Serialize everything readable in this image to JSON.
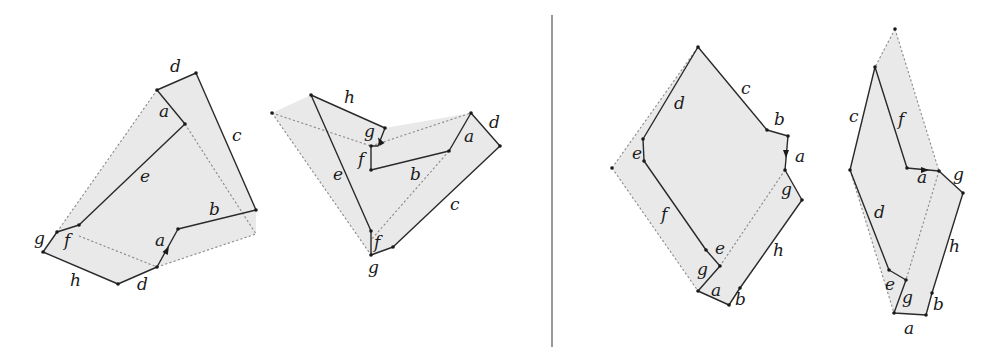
{
  "diagram": {
    "width": 984,
    "height": 357,
    "colors": {
      "fill": "#e9e9e9",
      "solid": "#2a2a2a",
      "dashed": "#8a8a8a",
      "divider": "#555555"
    },
    "divider": {
      "x": 552,
      "y1": 15,
      "y2": 347
    },
    "figures": [
      {
        "name": "figure-1",
        "fill": [
          [
            157,
            90
          ],
          [
            196,
            73
          ],
          [
            256,
            210
          ],
          [
            256,
            234
          ],
          [
            157,
            267
          ],
          [
            118,
            284
          ],
          [
            43,
            252
          ],
          [
            57,
            232
          ]
        ],
        "solid": [
          [
            [
              157,
              90
            ],
            [
              196,
              73
            ],
            [
              256,
              210
            ],
            [
              178,
              229
            ],
            [
              157,
              267
            ],
            [
              118,
              284
            ],
            [
              43,
              252
            ],
            [
              57,
              232
            ],
            [
              79,
              225
            ],
            [
              185,
              124
            ],
            [
              157,
              90
            ]
          ]
        ],
        "dashed": [
          [
            [
              57,
              232
            ],
            [
              157,
              90
            ]
          ],
          [
            [
              185,
              124
            ],
            [
              256,
              234
            ],
            [
              157,
              267
            ]
          ],
          [
            [
              79,
              236
            ],
            [
              157,
              267
            ]
          ]
        ],
        "arrows": [
          [
            167,
            250,
            -62
          ]
        ],
        "dots": [
          [
            157,
            90
          ],
          [
            196,
            73
          ],
          [
            185,
            124
          ],
          [
            256,
            210
          ],
          [
            178,
            229
          ],
          [
            157,
            267
          ],
          [
            118,
            284
          ],
          [
            43,
            252
          ],
          [
            57,
            232
          ],
          [
            79,
            225
          ]
        ],
        "labels": [
          {
            "t": "d",
            "x": 170,
            "y": 72
          },
          {
            "t": "a",
            "x": 159,
            "y": 117
          },
          {
            "t": "c",
            "x": 232,
            "y": 141
          },
          {
            "t": "e",
            "x": 140,
            "y": 182
          },
          {
            "t": "b",
            "x": 209,
            "y": 215
          },
          {
            "t": "g",
            "x": 34,
            "y": 244
          },
          {
            "t": "f",
            "x": 64,
            "y": 246
          },
          {
            "t": "a",
            "x": 155,
            "y": 246
          },
          {
            "t": "h",
            "x": 70,
            "y": 286
          },
          {
            "t": "d",
            "x": 137,
            "y": 290
          }
        ]
      },
      {
        "name": "figure-2",
        "fill": [
          [
            272,
            113
          ],
          [
            311,
            95
          ],
          [
            385,
            128
          ],
          [
            471,
            113
          ],
          [
            500,
            146
          ],
          [
            393,
            247
          ],
          [
            371,
            255
          ]
        ],
        "solid": [
          [
            [
              311,
              95
            ],
            [
              385,
              128
            ],
            [
              378,
              146
            ],
            [
              371,
              146
            ],
            [
              371,
              170
            ],
            [
              449,
              151
            ],
            [
              471,
              113
            ],
            [
              500,
              146
            ],
            [
              393,
              247
            ],
            [
              371,
              255
            ],
            [
              371,
              231
            ],
            [
              311,
              95
            ]
          ]
        ],
        "dashed": [
          [
            [
              272,
              113
            ],
            [
              371,
              255
            ]
          ],
          [
            [
              272,
              113
            ],
            [
              371,
              146
            ]
          ],
          [
            [
              371,
              146
            ],
            [
              471,
              113
            ]
          ],
          [
            [
              449,
              151
            ],
            [
              371,
              240
            ]
          ]
        ],
        "arrows": [
          [
            380,
            141,
            -120
          ]
        ],
        "dots": [
          [
            311,
            95
          ],
          [
            385,
            128
          ],
          [
            371,
            146
          ],
          [
            371,
            170
          ],
          [
            449,
            151
          ],
          [
            471,
            113
          ],
          [
            500,
            146
          ],
          [
            393,
            247
          ],
          [
            371,
            255
          ],
          [
            371,
            231
          ],
          [
            272,
            113
          ]
        ],
        "labels": [
          {
            "t": "h",
            "x": 344,
            "y": 103
          },
          {
            "t": "g",
            "x": 364,
            "y": 137
          },
          {
            "t": "f",
            "x": 358,
            "y": 165
          },
          {
            "t": "a",
            "x": 464,
            "y": 142
          },
          {
            "t": "d",
            "x": 489,
            "y": 128
          },
          {
            "t": "e",
            "x": 333,
            "y": 180
          },
          {
            "t": "b",
            "x": 410,
            "y": 180
          },
          {
            "t": "c",
            "x": 450,
            "y": 210
          },
          {
            "t": "f",
            "x": 374,
            "y": 248
          },
          {
            "t": "g",
            "x": 368,
            "y": 273
          }
        ]
      },
      {
        "name": "figure-3",
        "fill": [
          [
            698,
            47
          ],
          [
            767,
            130
          ],
          [
            788,
            136
          ],
          [
            785,
            170
          ],
          [
            802,
            200
          ],
          [
            729,
            305
          ],
          [
            698,
            291
          ],
          [
            612,
            168
          ]
        ],
        "solid": [
          [
            [
              698,
              47
            ],
            [
              767,
              130
            ],
            [
              788,
              136
            ],
            [
              785,
              170
            ],
            [
              802,
              200
            ],
            [
              740,
              288
            ],
            [
              729,
              305
            ],
            [
              698,
              291
            ],
            [
              720,
              266
            ],
            [
              706,
              250
            ],
            [
              644,
              161
            ],
            [
              643,
              139
            ],
            [
              698,
              47
            ]
          ]
        ],
        "dashed": [
          [
            [
              612,
              168
            ],
            [
              698,
              47
            ]
          ],
          [
            [
              612,
              168
            ],
            [
              698,
              291
            ]
          ],
          [
            [
              785,
              170
            ],
            [
              720,
              266
            ]
          ]
        ],
        "arrows": [
          [
            786,
            154,
            90
          ]
        ],
        "dots": [
          [
            698,
            47
          ],
          [
            767,
            130
          ],
          [
            788,
            136
          ],
          [
            785,
            170
          ],
          [
            802,
            200
          ],
          [
            740,
            288
          ],
          [
            729,
            305
          ],
          [
            698,
            291
          ],
          [
            720,
            266
          ],
          [
            706,
            250
          ],
          [
            644,
            161
          ],
          [
            643,
            139
          ],
          [
            612,
            168
          ]
        ],
        "labels": [
          {
            "t": "c",
            "x": 741,
            "y": 94
          },
          {
            "t": "d",
            "x": 674,
            "y": 109
          },
          {
            "t": "b",
            "x": 774,
            "y": 125
          },
          {
            "t": "a",
            "x": 795,
            "y": 162
          },
          {
            "t": "e",
            "x": 632,
            "y": 159
          },
          {
            "t": "g",
            "x": 781,
            "y": 195
          },
          {
            "t": "f",
            "x": 661,
            "y": 220
          },
          {
            "t": "h",
            "x": 773,
            "y": 256
          },
          {
            "t": "e",
            "x": 715,
            "y": 254
          },
          {
            "t": "g",
            "x": 697,
            "y": 275
          },
          {
            "t": "a",
            "x": 711,
            "y": 296
          },
          {
            "t": "b",
            "x": 735,
            "y": 305
          }
        ]
      },
      {
        "name": "figure-4",
        "fill": [
          [
            895,
            29
          ],
          [
            939,
            171
          ],
          [
            963,
            193
          ],
          [
            932,
            293
          ],
          [
            926,
            315
          ],
          [
            894,
            313
          ],
          [
            850,
            170
          ],
          [
            875,
            67
          ]
        ],
        "solid": [
          [
            [
              875,
              67
            ],
            [
              850,
              170
            ],
            [
              889,
              270
            ],
            [
              906,
              280
            ],
            [
              894,
              313
            ],
            [
              926,
              315
            ],
            [
              932,
              293
            ],
            [
              963,
              193
            ],
            [
              939,
              171
            ],
            [
              907,
              168
            ],
            [
              875,
              67
            ]
          ]
        ],
        "dashed": [
          [
            [
              895,
              29
            ],
            [
              939,
              171
            ]
          ],
          [
            [
              895,
              29
            ],
            [
              875,
              67
            ]
          ],
          [
            [
              850,
              170
            ],
            [
              894,
              313
            ]
          ],
          [
            [
              939,
              171
            ],
            [
              906,
              280
            ]
          ]
        ],
        "arrows": [
          [
            925,
            170,
            0
          ]
        ],
        "dots": [
          [
            895,
            29
          ],
          [
            875,
            67
          ],
          [
            850,
            170
          ],
          [
            907,
            168
          ],
          [
            939,
            171
          ],
          [
            963,
            193
          ],
          [
            932,
            293
          ],
          [
            926,
            315
          ],
          [
            894,
            313
          ],
          [
            906,
            280
          ],
          [
            889,
            270
          ]
        ],
        "labels": [
          {
            "t": "c",
            "x": 849,
            "y": 122
          },
          {
            "t": "f",
            "x": 898,
            "y": 125
          },
          {
            "t": "a",
            "x": 917,
            "y": 183
          },
          {
            "t": "g",
            "x": 953,
            "y": 180
          },
          {
            "t": "d",
            "x": 874,
            "y": 218
          },
          {
            "t": "h",
            "x": 949,
            "y": 252
          },
          {
            "t": "e",
            "x": 885,
            "y": 290
          },
          {
            "t": "g",
            "x": 902,
            "y": 303
          },
          {
            "t": "b",
            "x": 933,
            "y": 310
          },
          {
            "t": "a",
            "x": 904,
            "y": 334
          }
        ]
      }
    ]
  }
}
